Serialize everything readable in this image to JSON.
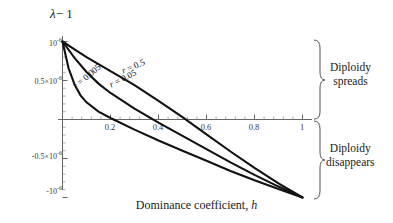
{
  "chart_data": {
    "type": "line",
    "title": "",
    "ylabel": "λ − 1",
    "xlabel": "Dominance coefficient, h",
    "xlabel_plain": "Dominance coefficient",
    "xlabel_symbol": "h",
    "ylabel_symbol": "λ",
    "ylabel_rest": "− 1",
    "xlim": [
      0,
      1.06
    ],
    "ylim": [
      -1.15e-06,
      1.15e-06
    ],
    "xticks": [
      0.2,
      0.4,
      0.6,
      0.8,
      1
    ],
    "xtick_labels": [
      "0.2",
      "0.4",
      "0.6",
      "0.8",
      "1"
    ],
    "yticks": [
      1e-06,
      5e-07,
      -5e-07,
      -1e-06
    ],
    "ytick_labels": [
      "10",
      "0.5×10",
      "-0.5×10",
      "-10"
    ],
    "ytick_exponents": [
      "-6",
      "-6",
      "-6",
      "-6"
    ],
    "grid": false,
    "legend_position": "inline-on-curves",
    "axis_color": "#555555",
    "curve_color": "#111111",
    "series": [
      {
        "name": "r = 0.5",
        "label_prefix": "r",
        "label_value": "= 0.5",
        "zero_crossing": 0.48,
        "x": [
          0,
          0.05,
          0.1,
          0.15,
          0.2,
          0.3,
          0.4,
          0.5,
          0.6,
          0.7,
          0.8,
          0.9,
          1
        ],
        "y": [
          1e-06,
          9e-07,
          8e-07,
          7.1e-07,
          6.2e-07,
          4.4e-07,
          2.4e-07,
          3e-08,
          -1.9e-07,
          -4.1e-07,
          -6.2e-07,
          -8.2e-07,
          -1e-06
        ]
      },
      {
        "name": "r = 0.05",
        "label_prefix": "r",
        "label_value": "= 0.05",
        "zero_crossing": 0.375,
        "x": [
          0,
          0.05,
          0.1,
          0.15,
          0.2,
          0.3,
          0.4,
          0.5,
          0.6,
          0.7,
          0.8,
          0.9,
          1
        ],
        "y": [
          1e-06,
          7.9e-07,
          6.1e-07,
          4.6e-07,
          3.4e-07,
          1.4e-07,
          -4e-08,
          -2.1e-07,
          -3.8e-07,
          -5.5e-07,
          -7.1e-07,
          -8.6e-07,
          -1e-06
        ]
      },
      {
        "name": "r = 0.005",
        "label_prefix": "r",
        "label_value": "= 0.005",
        "zero_crossing": 0.21,
        "x": [
          0,
          0.025,
          0.05,
          0.075,
          0.1,
          0.15,
          0.2,
          0.3,
          0.4,
          0.5,
          0.6,
          0.7,
          0.8,
          0.9,
          1
        ],
        "y": [
          1e-06,
          6.6e-07,
          4.5e-07,
          3.1e-07,
          2.2e-07,
          1e-07,
          2e-08,
          -1.3e-07,
          -2.7e-07,
          -4e-07,
          -5.3e-07,
          -6.6e-07,
          -7.8e-07,
          -8.9e-07,
          -1e-06
        ]
      }
    ],
    "annotations": [
      {
        "name": "diploidy-spreads",
        "line1": "Diploidy",
        "line2": "spreads",
        "region": "above-zero"
      },
      {
        "name": "diploidy-disappears",
        "line1": "Diploidy",
        "line2": "disappears",
        "region": "below-zero"
      }
    ]
  }
}
